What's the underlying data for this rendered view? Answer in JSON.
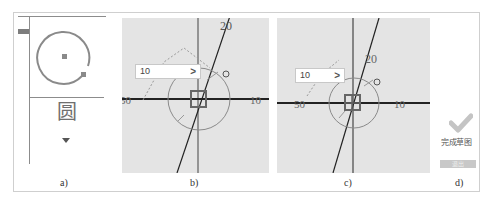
{
  "figure": {
    "captions": {
      "a": "a)",
      "b": "b)",
      "c": "c)",
      "d": "d)"
    }
  },
  "panel_a": {
    "tool_label": "圆",
    "tool_icon": "circle-icon",
    "dropdown_icon": "triangle-down-icon"
  },
  "panel_b": {
    "dimension_input": {
      "value": "10",
      "confirm_glyph": ">"
    },
    "axis_labels": {
      "top": "20",
      "left": "50",
      "right": "10"
    }
  },
  "panel_c": {
    "dimension_input": {
      "value": "10",
      "confirm_glyph": ">"
    },
    "axis_labels": {
      "top": "20",
      "left": "50",
      "right": "10"
    }
  },
  "panel_d": {
    "finish_sketch_label": "完成草图",
    "finish_sketch_icon": "checkmark-icon",
    "exit_label": "退出"
  },
  "colors": {
    "canvas_bg": "#e4e4e4",
    "axis_line": "#333333",
    "sketch_gray": "#8a8a8a",
    "checkmark": "#c4c4c4"
  }
}
